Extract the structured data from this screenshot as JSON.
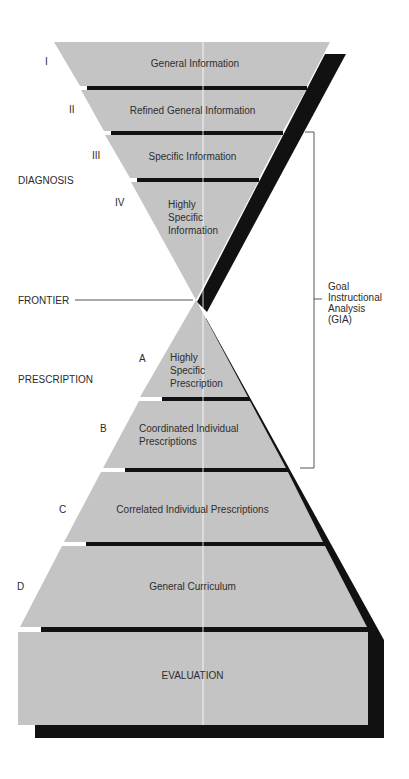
{
  "diagram": {
    "type": "hourglass-funnel",
    "colors": {
      "band_fill": "#c4c4c4",
      "shadow": "#111111",
      "bracket": "#555555",
      "background": "#ffffff"
    },
    "diagnosis_levels": [
      {
        "numeral": "I",
        "label": "General Information"
      },
      {
        "numeral": "II",
        "label": "Refined General Information"
      },
      {
        "numeral": "III",
        "label": "Specific Information"
      },
      {
        "numeral": "IV",
        "label_lines": [
          "Highly",
          "Specific",
          "Information"
        ]
      }
    ],
    "prescription_levels": [
      {
        "letter": "A",
        "label_lines": [
          "Highly",
          "Specific",
          "Prescription"
        ]
      },
      {
        "letter": "B",
        "label_lines": [
          "Coordinated Individual",
          "Prescriptions"
        ]
      },
      {
        "letter": "C",
        "label": "Correlated Individual Prescriptions"
      },
      {
        "letter": "D",
        "label": "General Curriculum"
      }
    ],
    "base": {
      "label": "EVALUATION"
    },
    "side_labels": {
      "diagnosis": "DIAGNOSIS",
      "frontier": "FRONTIER",
      "prescription": "PRESCRIPTION"
    },
    "bracket": {
      "label_lines": [
        "Goal",
        "Instructional",
        "Analysis",
        "(GIA)"
      ]
    }
  }
}
